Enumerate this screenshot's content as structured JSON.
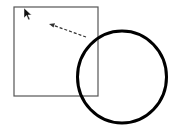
{
  "canvas": {
    "width": 176,
    "height": 130,
    "background": "#ffffff"
  },
  "shapes": {
    "rectangle": {
      "x": 14,
      "y": 7,
      "width": 84,
      "height": 89,
      "stroke": "#555555",
      "stroke_width": 1.2
    },
    "circle": {
      "cx": 122,
      "cy": 77,
      "rx": 45,
      "ry": 46,
      "stroke": "#000000",
      "stroke_width": 3
    },
    "dashed_arrow": {
      "x1": 86,
      "y1": 37,
      "x2": 50,
      "y2": 24,
      "stroke": "#333333",
      "dash": "3,2"
    }
  },
  "cursor": {
    "icon": "mouse-pointer-icon",
    "x": 24,
    "y": 8
  }
}
